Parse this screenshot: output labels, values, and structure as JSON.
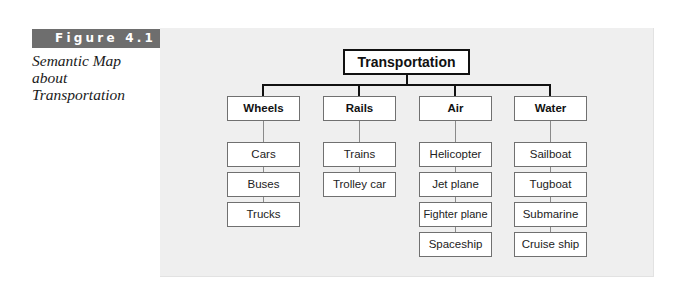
{
  "figure": {
    "label": "Figure 4.1",
    "caption": "Semantic Map about Transportation"
  },
  "map": {
    "root": "Transportation",
    "categories": [
      {
        "label": "Wheels",
        "items": [
          "Cars",
          "Buses",
          "Trucks"
        ]
      },
      {
        "label": "Rails",
        "items": [
          "Trains",
          "Trolley car"
        ]
      },
      {
        "label": "Air",
        "items": [
          "Helicopter",
          "Jet plane",
          "Fighter plane",
          "Spaceship"
        ]
      },
      {
        "label": "Water",
        "items": [
          "Sailboat",
          "Tugboat",
          "Submarine",
          "Cruise ship"
        ]
      }
    ]
  }
}
